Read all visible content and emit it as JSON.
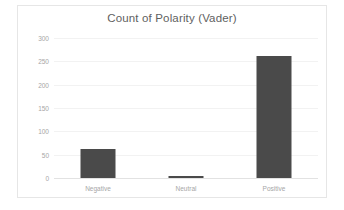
{
  "chart_data": {
    "type": "bar",
    "title": "Count of Polarity (Vader)",
    "xlabel": "",
    "ylabel": "",
    "categories": [
      "Negative",
      "Neutral",
      "Positive"
    ],
    "values": [
      63,
      4,
      262
    ],
    "ylim": [
      0,
      300
    ],
    "yticks": [
      0,
      50,
      100,
      150,
      200,
      250,
      300
    ],
    "ytick_labels": [
      "0",
      "50",
      "100",
      "150",
      "200",
      "250",
      "300"
    ],
    "grid": true,
    "legend": false,
    "bar_color": "#4a4a4a",
    "title_color": "#5f5f5f",
    "tick_label_color": "#a6a6a6",
    "gridline_color": "#f2f2f2",
    "background_color": "#ffffff",
    "border_color": "#e6e6e6"
  }
}
